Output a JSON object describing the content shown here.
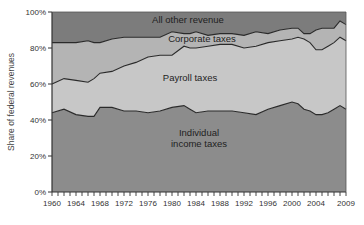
{
  "chart_data": {
    "type": "area",
    "stacked": true,
    "title": "",
    "xlabel": "",
    "ylabel": "Share of federal revenues",
    "ylim": [
      0,
      100
    ],
    "xlim": [
      1960,
      2009
    ],
    "grid": false,
    "legend": "inline labels",
    "x_tick_labels": [
      "1960",
      "1964",
      "1968",
      "1972",
      "1976",
      "1980",
      "1984",
      "1988",
      "1992",
      "1996",
      "2000",
      "2004",
      "2009"
    ],
    "y_tick_labels": [
      "0%",
      "20%",
      "40%",
      "60%",
      "80%",
      "100%"
    ],
    "x": [
      1960,
      1962,
      1964,
      1966,
      1967,
      1968,
      1970,
      1972,
      1974,
      1976,
      1978,
      1980,
      1982,
      1983,
      1984,
      1986,
      1988,
      1990,
      1992,
      1994,
      1996,
      1998,
      2000,
      2001,
      2002,
      2003,
      2004,
      2005,
      2006,
      2007,
      2008,
      2009
    ],
    "series": [
      {
        "name": "Individual income taxes",
        "label_lines": [
          "Individual",
          "income taxes"
        ],
        "color": "#8c8c8c",
        "values": [
          44,
          46,
          43,
          42,
          42,
          47,
          47,
          45,
          45,
          44,
          45,
          47,
          48,
          46,
          44,
          45,
          45,
          45,
          44,
          43,
          46,
          48,
          50,
          49,
          46,
          45,
          43,
          43,
          44,
          46,
          48,
          46
        ]
      },
      {
        "name": "Payroll taxes",
        "label_lines": [
          "Payroll taxes"
        ],
        "color": "#c7c7c7",
        "values": [
          16,
          17,
          19,
          19,
          21,
          19,
          20,
          25,
          27,
          31,
          31,
          29,
          33,
          34,
          36,
          36,
          37,
          37,
          36,
          38,
          37,
          36,
          35,
          37,
          39,
          38,
          36,
          36,
          37,
          37,
          38,
          38
        ]
      },
      {
        "name": "Corporate taxes",
        "label_lines": [
          "Corporate taxes"
        ],
        "color": "#b4b4b4",
        "values": [
          23,
          20,
          21,
          23,
          20,
          17,
          18,
          16,
          14,
          11,
          10,
          13,
          7,
          8,
          9,
          6,
          6,
          6,
          7,
          8,
          5,
          6,
          6,
          5,
          3,
          5,
          11,
          12,
          10,
          8,
          9,
          9
        ]
      },
      {
        "name": "All other revenue",
        "label_lines": [
          "All other revenue"
        ],
        "color": "#7c7c7c",
        "values": [
          17,
          17,
          17,
          16,
          17,
          17,
          15,
          14,
          14,
          14,
          14,
          11,
          12,
          12,
          11,
          13,
          12,
          12,
          13,
          11,
          12,
          10,
          9,
          9,
          12,
          12,
          10,
          9,
          9,
          9,
          5,
          7
        ]
      }
    ]
  }
}
